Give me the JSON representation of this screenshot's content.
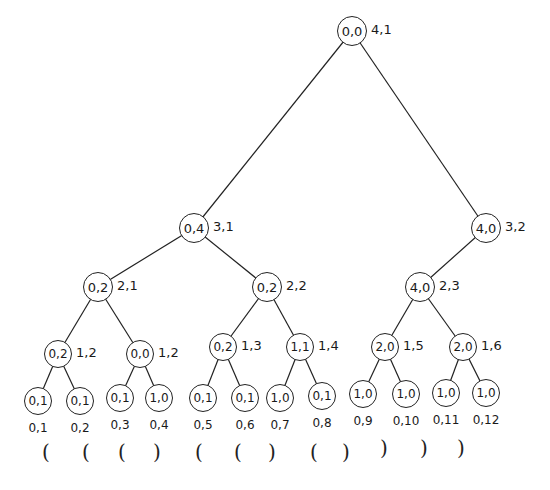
{
  "diagram": {
    "type": "binary-tree",
    "levels": [
      [
        {
          "id": "n0",
          "node": "0,0",
          "label": "4,1",
          "x": 352,
          "y": 16,
          "r": 15
        }
      ],
      [
        {
          "id": "n1",
          "node": "0,4",
          "label": "3,1",
          "x": 194,
          "y": 213,
          "r": 15,
          "parent": "n0"
        },
        {
          "id": "n2",
          "node": "4,0",
          "label": "3,2",
          "x": 486,
          "y": 213,
          "r": 15,
          "parent": "n0"
        }
      ],
      [
        {
          "id": "n3",
          "node": "0,2",
          "label": "2,1",
          "x": 98,
          "y": 272,
          "r": 15,
          "parent": "n1"
        },
        {
          "id": "n4",
          "node": "0,2",
          "label": "2,2",
          "x": 267,
          "y": 272,
          "r": 15,
          "parent": "n1"
        },
        {
          "id": "n5",
          "node": "4,0",
          "label": "2,3",
          "x": 420,
          "y": 272,
          "r": 15,
          "parent": "n2"
        }
      ],
      [
        {
          "id": "n6",
          "node": "0,2",
          "label": "1,2",
          "x": 58,
          "y": 340,
          "r": 14,
          "parent": "n3"
        },
        {
          "id": "n7",
          "node": "0,0",
          "label": "1,2",
          "x": 140,
          "y": 340,
          "r": 14,
          "parent": "n3"
        },
        {
          "id": "n8",
          "node": "0,2",
          "label": "1,3",
          "x": 223,
          "y": 333,
          "r": 14,
          "parent": "n4"
        },
        {
          "id": "n9",
          "node": "1,1",
          "label": "1,4",
          "x": 300,
          "y": 333,
          "r": 14,
          "parent": "n4"
        },
        {
          "id": "n10",
          "node": "2,0",
          "label": "1,5",
          "x": 385,
          "y": 333,
          "r": 14,
          "parent": "n5"
        },
        {
          "id": "n11",
          "node": "2,0",
          "label": "1,6",
          "x": 463,
          "y": 333,
          "r": 14,
          "parent": "n5"
        }
      ],
      [
        {
          "id": "n12",
          "node": "0,1",
          "label": "0,1",
          "x": 38,
          "y": 387,
          "r": 14,
          "parent": "n6"
        },
        {
          "id": "n13",
          "node": "0,1",
          "label": "0,2",
          "x": 80,
          "y": 387,
          "r": 14,
          "parent": "n6"
        },
        {
          "id": "n14",
          "node": "0,1",
          "label": "0,3",
          "x": 120,
          "y": 384,
          "r": 14,
          "parent": "n7"
        },
        {
          "id": "n15",
          "node": "1,0",
          "label": "0,4",
          "x": 159,
          "y": 384,
          "r": 14,
          "parent": "n7"
        },
        {
          "id": "n16",
          "node": "0,1",
          "label": "0,5",
          "x": 203,
          "y": 384,
          "r": 14,
          "parent": "n8"
        },
        {
          "id": "n17",
          "node": "0,1",
          "label": "0,6",
          "x": 245,
          "y": 384,
          "r": 14,
          "parent": "n8"
        },
        {
          "id": "n18",
          "node": "1,0",
          "label": "0,7",
          "x": 280,
          "y": 384,
          "r": 14,
          "parent": "n9"
        },
        {
          "id": "n19",
          "node": "0,1",
          "label": "0,8",
          "x": 322,
          "y": 382,
          "r": 14,
          "parent": "n9"
        },
        {
          "id": "n20",
          "node": "1,0",
          "label": "0,9",
          "x": 363,
          "y": 380,
          "r": 14,
          "parent": "n10"
        },
        {
          "id": "n21",
          "node": "1,0",
          "label": "0,10",
          "x": 406,
          "y": 380,
          "r": 14,
          "parent": "n10"
        },
        {
          "id": "n22",
          "node": "1,0",
          "label": "0,11",
          "x": 446,
          "y": 379,
          "r": 14,
          "parent": "n11"
        },
        {
          "id": "n23",
          "node": "1,0",
          "label": "0,12",
          "x": 486,
          "y": 379,
          "r": 14,
          "parent": "n11"
        }
      ]
    ],
    "parentheses": [
      {
        "char": "(",
        "x": 42
      },
      {
        "char": "(",
        "x": 82
      },
      {
        "char": "(",
        "x": 118
      },
      {
        "char": ")",
        "x": 153
      },
      {
        "char": "(",
        "x": 195
      },
      {
        "char": "(",
        "x": 234
      },
      {
        "char": ")",
        "x": 268
      },
      {
        "char": "(",
        "x": 310
      },
      {
        "char": ")",
        "x": 342
      },
      {
        "char": ")",
        "x": 380
      },
      {
        "char": ")",
        "x": 420
      },
      {
        "char": ")",
        "x": 457
      }
    ],
    "paren_sequence": "((()(()()))))"
  }
}
